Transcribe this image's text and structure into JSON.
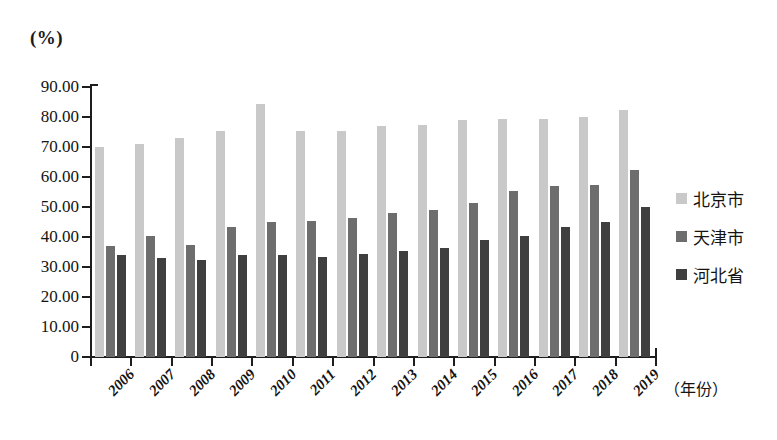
{
  "chart_data": {
    "type": "bar",
    "title": "",
    "subtitle": "",
    "xlabel": "（年份）",
    "ylabel": "(%)",
    "categories": [
      "2006",
      "2007",
      "2008",
      "2009",
      "2010",
      "2011",
      "2012",
      "2013",
      "2014",
      "2015",
      "2016",
      "2017",
      "2018",
      "2019"
    ],
    "series": [
      {
        "name": "北京市",
        "color": "#c9c9c9",
        "values": [
          70.0,
          71.0,
          73.0,
          75.5,
          84.5,
          75.5,
          75.5,
          77.0,
          77.5,
          79.0,
          79.5,
          79.5,
          80.0,
          82.5
        ]
      },
      {
        "name": "天津市",
        "color": "#6d6d6d",
        "values": [
          37.0,
          40.5,
          37.5,
          43.5,
          45.0,
          45.5,
          46.5,
          48.0,
          49.0,
          51.5,
          55.5,
          57.0,
          57.5,
          62.5
        ]
      },
      {
        "name": "河北省",
        "color": "#3f3f3f",
        "values": [
          34.0,
          33.0,
          32.5,
          34.0,
          34.0,
          33.5,
          34.5,
          35.5,
          36.5,
          39.0,
          40.5,
          43.5,
          45.0,
          50.0
        ]
      }
    ],
    "ylim": [
      0,
      90
    ],
    "yticks": [
      "0",
      "10.00",
      "20.00",
      "30.00",
      "40.00",
      "50.00",
      "60.00",
      "70.00",
      "80.00",
      "90.00"
    ],
    "ytick_values": [
      0,
      10,
      20,
      30,
      40,
      50,
      60,
      70,
      80,
      90
    ],
    "grid": false,
    "legend_position": "right"
  },
  "legend": {
    "items": [
      {
        "label": "北京市",
        "swatch": "legend-swatch-beijing"
      },
      {
        "label": "天津市",
        "swatch": "legend-swatch-tianjin"
      },
      {
        "label": "河北省",
        "swatch": "legend-swatch-hebei"
      }
    ]
  }
}
